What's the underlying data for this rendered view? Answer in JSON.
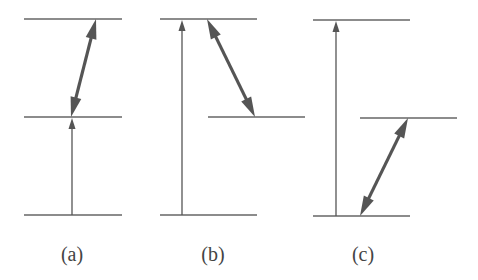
{
  "figure": {
    "type": "energy-level-diagram",
    "line_color": "#666666",
    "thick_arrow_color": "#555555",
    "panels": [
      {
        "id": "a",
        "label": "(a)",
        "label_x": 72,
        "levels": [
          {
            "name": "upper",
            "x1": 24,
            "x2": 122,
            "y": 19
          },
          {
            "name": "middle",
            "x1": 24,
            "x2": 122,
            "y": 117
          },
          {
            "name": "lower",
            "x1": 24,
            "x2": 122,
            "y": 215
          }
        ],
        "thin_arrows": [
          {
            "x1": 72,
            "y1": 215,
            "x2": 72,
            "y2": 118
          }
        ],
        "thick_arrows": [
          {
            "x1": 71,
            "y1": 117,
            "x2": 96,
            "y2": 19
          }
        ]
      },
      {
        "id": "b",
        "label": "(b)",
        "label_x": 213,
        "levels": [
          {
            "name": "upper",
            "x1": 160,
            "x2": 257,
            "y": 19
          },
          {
            "name": "middle",
            "x1": 208,
            "x2": 305,
            "y": 117
          },
          {
            "name": "lower",
            "x1": 160,
            "x2": 257,
            "y": 215
          }
        ],
        "thin_arrows": [
          {
            "x1": 182,
            "y1": 215,
            "x2": 182,
            "y2": 20
          }
        ],
        "thick_arrows": [
          {
            "x1": 207,
            "y1": 19,
            "x2": 255,
            "y2": 117
          }
        ]
      },
      {
        "id": "c",
        "label": "(c)",
        "label_x": 363,
        "levels": [
          {
            "name": "upper",
            "x1": 313,
            "x2": 410,
            "y": 20
          },
          {
            "name": "middle",
            "x1": 360,
            "x2": 457,
            "y": 118
          },
          {
            "name": "lower",
            "x1": 313,
            "x2": 410,
            "y": 216
          }
        ],
        "thin_arrows": [
          {
            "x1": 336,
            "y1": 216,
            "x2": 336,
            "y2": 21
          }
        ],
        "thick_arrows": [
          {
            "x1": 360,
            "y1": 216,
            "x2": 408,
            "y2": 118
          }
        ]
      }
    ]
  }
}
